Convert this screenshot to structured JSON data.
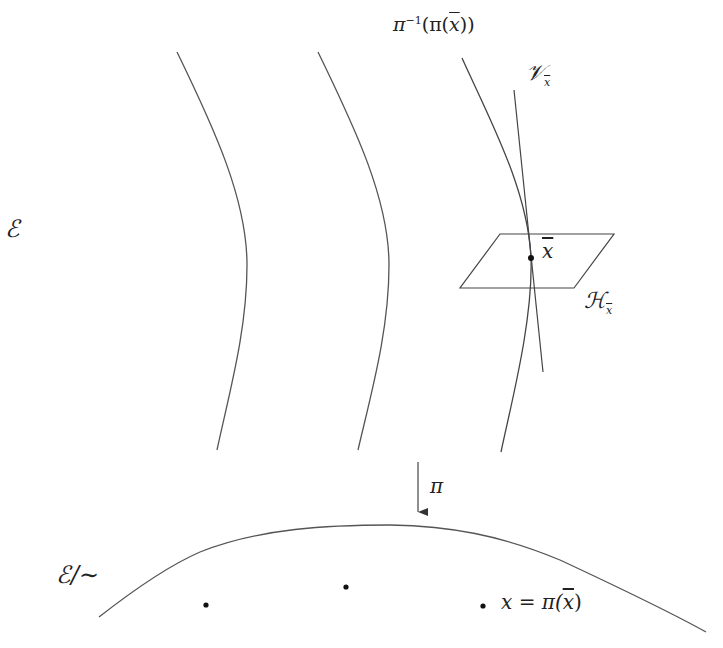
{
  "diagram": {
    "labels": {
      "total_space": "ℰ",
      "fiber": {
        "base": "π",
        "sup": "−1",
        "rest_open": "(π(",
        "xbar": "x",
        "rest_close": "))"
      },
      "vertical_space": {
        "base": "𝒱",
        "sub": "x"
      },
      "horizontal_space": {
        "base": "ℋ",
        "sub": "x"
      },
      "point": "x",
      "projection": "π",
      "quotient_space": "ℰ/∼",
      "projected_point": {
        "lhs": "x = π(",
        "xbar": "x",
        "rhs": ")"
      }
    },
    "colors": {
      "stroke": "#444444",
      "text": "#222222",
      "background": "#ffffff"
    },
    "fibers": [
      {
        "id": "fiber-1",
        "path": "M177,52 C215,130 247,200 247,265 C247,330 230,390 217,450"
      },
      {
        "id": "fiber-2",
        "path": "M318,52 C356,130 389,200 389,265 C389,330 372,390 358,450"
      },
      {
        "id": "fiber-3",
        "path": "M462,58 C490,120 528,190 531,258 C533,320 512,400 501,452"
      }
    ],
    "tangent_line": {
      "x1": 514,
      "y1": 90,
      "x2": 543,
      "y2": 372
    },
    "horizontal_plane": "500,234 614,234 574,288 460,288",
    "point_xbar": {
      "cx": 531,
      "cy": 258
    },
    "projection_arrow": {
      "x": 418,
      "y1": 462,
      "y2": 512
    },
    "quotient_curve": "M99,617 C140,585 170,565 200,552 C260,528 330,525 390,525 C450,526 500,535 560,560 C620,588 670,612 706,632",
    "quotient_points": [
      {
        "cx": 206,
        "cy": 605
      },
      {
        "cx": 346,
        "cy": 587
      },
      {
        "cx": 483,
        "cy": 606
      }
    ]
  }
}
